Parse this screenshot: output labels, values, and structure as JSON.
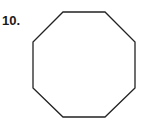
{
  "problem": {
    "number_label": "10.",
    "shape": "octagon",
    "stroke_color": "#222222",
    "fill_color": "#ffffff",
    "vertices": [
      [
        63,
        12
      ],
      [
        105,
        12
      ],
      [
        135,
        42
      ],
      [
        135,
        88
      ],
      [
        105,
        117
      ],
      [
        63,
        117
      ],
      [
        33,
        88
      ],
      [
        33,
        42
      ]
    ]
  }
}
